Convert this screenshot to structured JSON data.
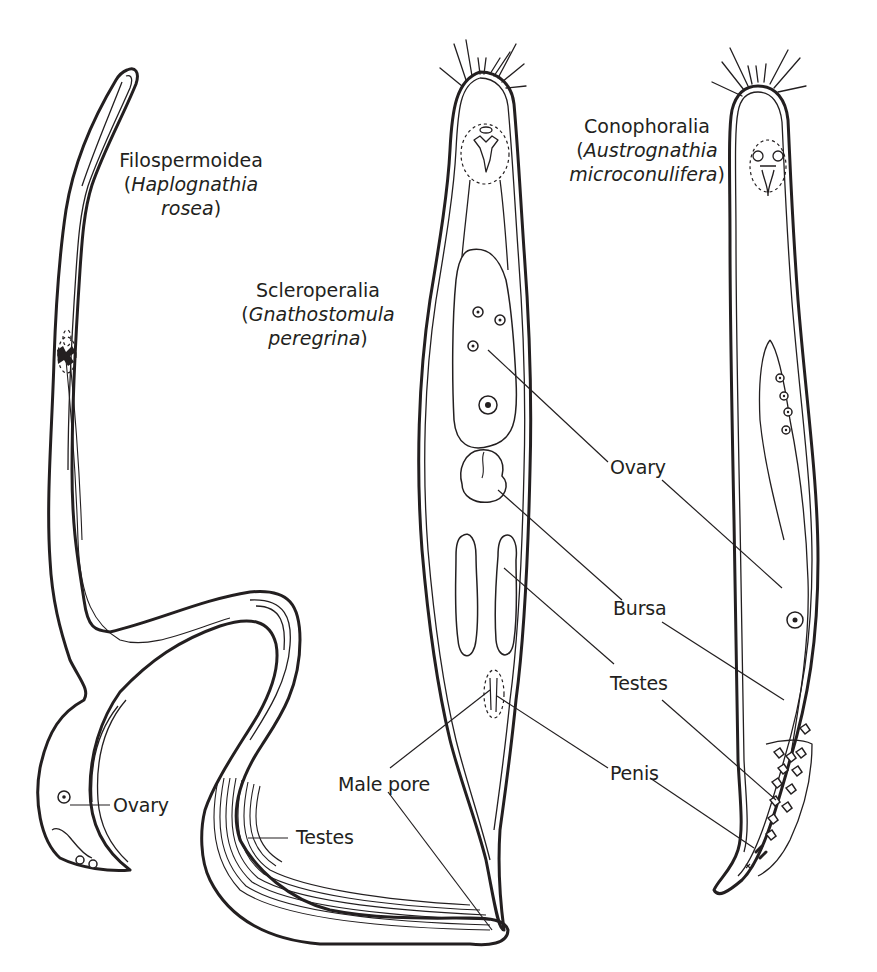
{
  "figure": {
    "background": "#ffffff",
    "ink_color": "#231f20",
    "species": [
      {
        "group": "Filospermoidea",
        "species_line1": "Haplognathia",
        "species_line2": "rosea",
        "open_paren": "(",
        "close_paren": ")"
      },
      {
        "group": "Scleroperalia",
        "species_line1": "Gnathostomula",
        "species_line2": "peregrina",
        "open_paren": "(",
        "close_paren": ")"
      },
      {
        "group": "Conophoralia",
        "species_line1": "Austrognathia",
        "species_line2": "microconulifera",
        "open_paren": "(",
        "close_paren": ")"
      }
    ],
    "labels": {
      "ovary_center": "Ovary",
      "bursa": "Bursa",
      "testes_center": "Testes",
      "penis": "Penis",
      "male_pore": "Male pore",
      "ovary_left": "Ovary",
      "testes_left": "Testes"
    }
  }
}
